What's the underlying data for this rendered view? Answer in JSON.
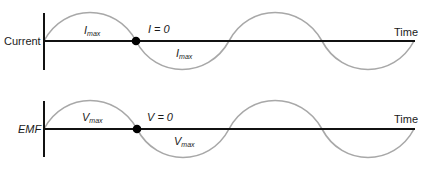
{
  "diagram": {
    "colors": {
      "axis": "#111111",
      "wave": "#a8a8a8",
      "dot": "#000000",
      "text": "#1a1a1a"
    },
    "panels": [
      {
        "id": "current",
        "axis_label": "Current",
        "axis_label_italic": false,
        "time_label": "Time",
        "zero_label": "I = 0",
        "max_symbol": "I",
        "max_subscript": "max",
        "upper_max_label": {
          "symbol": "I",
          "sub": "max"
        },
        "lower_max_label": {
          "symbol": "I",
          "sub": "max"
        }
      },
      {
        "id": "emf",
        "axis_label": "EMF",
        "axis_label_italic": true,
        "time_label": "Time",
        "zero_label": "V = 0",
        "max_symbol": "V",
        "max_subscript": "max",
        "upper_max_label": {
          "symbol": "V",
          "sub": "max"
        },
        "lower_max_label": {
          "symbol": "V",
          "sub": "max"
        }
      }
    ]
  }
}
